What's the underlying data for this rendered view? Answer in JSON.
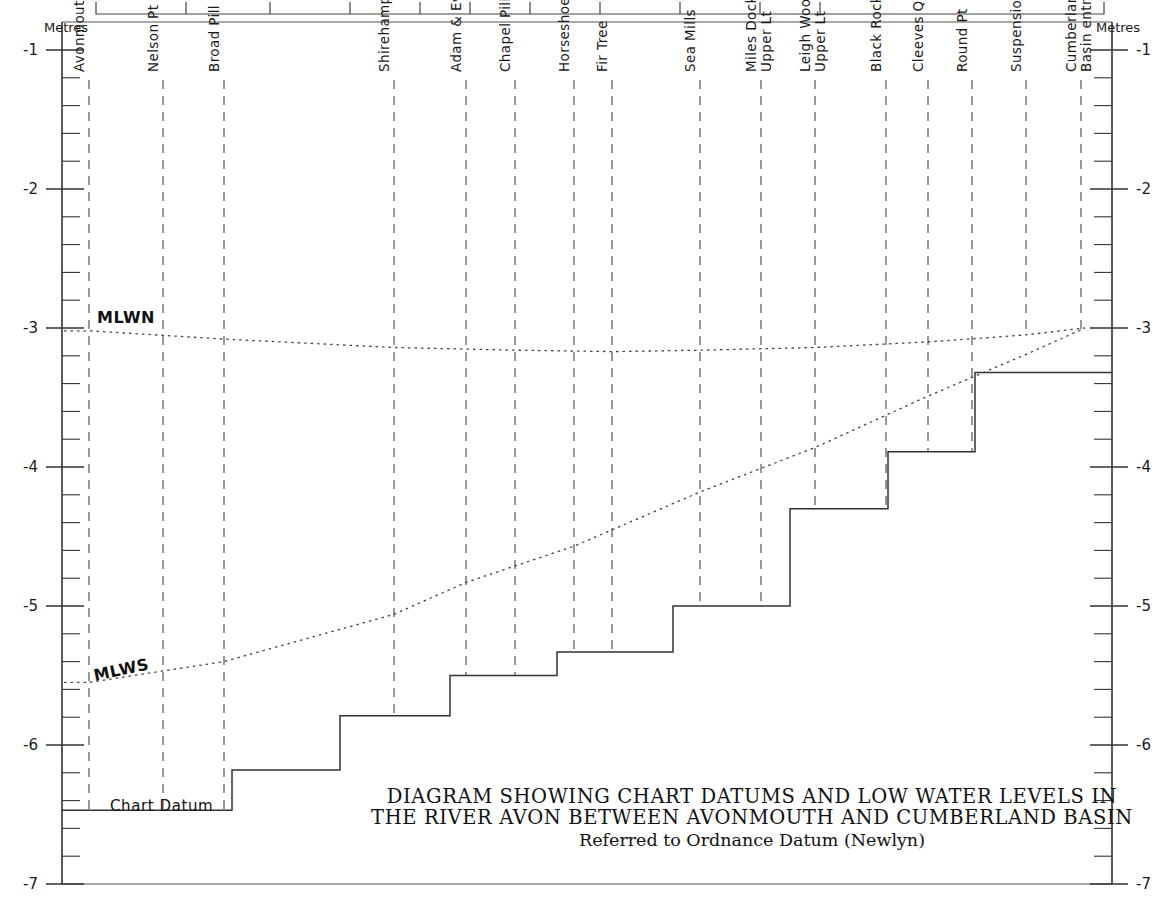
{
  "axes": {
    "left_title": "Metres",
    "right_title": "Metres",
    "tick_labels": [
      "-1",
      "-2",
      "-3",
      "-4",
      "-5",
      "-6",
      "-7"
    ],
    "tick_values": [
      -1,
      -2,
      -3,
      -4,
      -5,
      -6,
      -7
    ],
    "ylim": [
      -7,
      -1
    ],
    "minor_tick_step": 0.2
  },
  "labels": {
    "mlwn": "MLWN",
    "mlws": "MLWS",
    "chart_datum": "Chart Datum"
  },
  "title": {
    "line1": "DIAGRAM SHOWING CHART DATUMS AND LOW WATER LEVELS IN",
    "line2": "THE RIVER AVON BETWEEN AVONMOUTH AND CUMBERLAND BASIN",
    "line3": "Referred to Ordnance Datum (Newlyn)"
  },
  "chart_data": {
    "type": "line",
    "subtitle": "Referred to Ordnance Datum (Newlyn)",
    "xlabel": "",
    "ylabel": "Metres",
    "ylim": [
      -7,
      -1
    ],
    "grid": false,
    "legend": "none",
    "stations": [
      {
        "name": "Avonmouth",
        "x_px": 89
      },
      {
        "name": "Nelson Pt",
        "x_px": 163
      },
      {
        "name": "Broad Pill",
        "x_px": 224
      },
      {
        "name": "Shirehampton",
        "x_px": 394
      },
      {
        "name": "Adam & Eve",
        "x_px": 466
      },
      {
        "name": "Chapel Pill",
        "x_px": 515
      },
      {
        "name": "Horseshoe Lower Lt",
        "x_px": 574
      },
      {
        "name": "Fir Tree",
        "x_px": 612
      },
      {
        "name": "Sea Mills",
        "x_px": 700
      },
      {
        "name": "Miles Dock\nUpper Lt",
        "x_px": 761
      },
      {
        "name": "Leigh Woods\nUpper Lt",
        "x_px": 815
      },
      {
        "name": "Black Rock",
        "x_px": 886
      },
      {
        "name": "Cleeves Quarry",
        "x_px": 928
      },
      {
        "name": "Round Pt",
        "x_px": 972
      },
      {
        "name": "Suspension Bridge",
        "x_px": 1026
      },
      {
        "name": "Cumberland\nBasin entrance",
        "x_px": 1081
      }
    ],
    "series": [
      {
        "name": "Chart Datum",
        "style": "step",
        "points": [
          {
            "x_px": 62,
            "value": -6.47
          },
          {
            "x_px": 232,
            "value": -6.47
          },
          {
            "x_px": 232,
            "value": -6.18
          },
          {
            "x_px": 340,
            "value": -6.18
          },
          {
            "x_px": 340,
            "value": -5.79
          },
          {
            "x_px": 450,
            "value": -5.79
          },
          {
            "x_px": 450,
            "value": -5.5
          },
          {
            "x_px": 557,
            "value": -5.5
          },
          {
            "x_px": 557,
            "value": -5.33
          },
          {
            "x_px": 673,
            "value": -5.33
          },
          {
            "x_px": 673,
            "value": -5.0
          },
          {
            "x_px": 790,
            "value": -5.0
          },
          {
            "x_px": 790,
            "value": -4.3
          },
          {
            "x_px": 888,
            "value": -4.3
          },
          {
            "x_px": 888,
            "value": -3.89
          },
          {
            "x_px": 975,
            "value": -3.89
          },
          {
            "x_px": 975,
            "value": -3.32
          },
          {
            "x_px": 1112,
            "value": -3.32
          }
        ]
      },
      {
        "name": "MLWN",
        "style": "dotted",
        "points": [
          {
            "x_px": 89,
            "value": -3.02
          },
          {
            "x_px": 224,
            "value": -3.08
          },
          {
            "x_px": 394,
            "value": -3.14
          },
          {
            "x_px": 515,
            "value": -3.16
          },
          {
            "x_px": 612,
            "value": -3.17
          },
          {
            "x_px": 700,
            "value": -3.16
          },
          {
            "x_px": 815,
            "value": -3.14
          },
          {
            "x_px": 928,
            "value": -3.1
          },
          {
            "x_px": 1026,
            "value": -3.05
          },
          {
            "x_px": 1085,
            "value": -3.0
          }
        ]
      },
      {
        "name": "MLWS",
        "style": "dotted",
        "points": [
          {
            "x_px": 89,
            "value": -5.55
          },
          {
            "x_px": 224,
            "value": -5.4
          },
          {
            "x_px": 394,
            "value": -5.06
          },
          {
            "x_px": 466,
            "value": -4.83
          },
          {
            "x_px": 574,
            "value": -4.57
          },
          {
            "x_px": 700,
            "value": -4.18
          },
          {
            "x_px": 815,
            "value": -3.86
          },
          {
            "x_px": 928,
            "value": -3.49
          },
          {
            "x_px": 1026,
            "value": -3.19
          },
          {
            "x_px": 1085,
            "value": -3.0
          }
        ]
      }
    ]
  }
}
